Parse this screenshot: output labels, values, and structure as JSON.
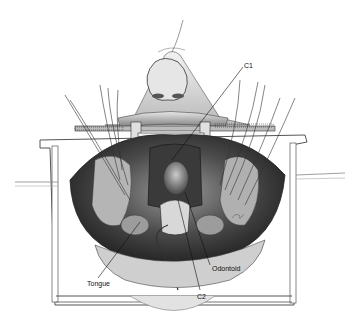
{
  "figure": {
    "labels": {
      "c1": "C1",
      "odontoid": "Odontoid",
      "tongue": "Tongue",
      "c2": "C2"
    },
    "colors": {
      "background": "#ffffff",
      "line": "#222222",
      "shade_dark": "#3a3a3a",
      "shade_mid": "#8a8a8a",
      "shade_light": "#d6d6d6"
    }
  }
}
